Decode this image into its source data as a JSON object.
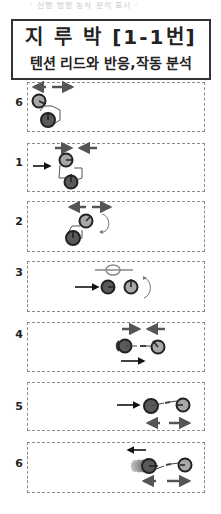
{
  "header": {
    "top_caption": "· 진행 방향 동작 분석 표시 ·",
    "title": "지 루 박 [1-1번]",
    "subtitle": "텐션 리드와 반응,작동 분석"
  },
  "colors": {
    "border": "#333333",
    "dashed_border": "#8c8c8c",
    "arrow_gray": "#555555",
    "arrow_black": "#111111",
    "ball_dark": "#5a5a5a",
    "ball_light": "#a8a8a8",
    "ghost": "#9a9a9a"
  },
  "steps": [
    {
      "label": "6",
      "description": "both players apart, spread arrows above"
    },
    {
      "label": "1",
      "description": "lead forward arrow, closing arrows above"
    },
    {
      "label": "2",
      "description": "rotation, spreading arrows above"
    },
    {
      "label": "3",
      "description": "forward arrow, partner rotates, tension bar above"
    },
    {
      "label": "4",
      "description": "closing arrows above, forward arrow below"
    },
    {
      "label": "5",
      "description": "forward arrow, spreading arrows below"
    },
    {
      "label": "6",
      "description": "back arrow above, spreading arrows below, ghosting"
    }
  ]
}
